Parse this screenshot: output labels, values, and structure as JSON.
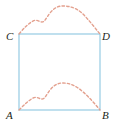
{
  "figure": {
    "type": "geometry-diagram",
    "colors": {
      "rectangle_stroke": "#8cc6e0",
      "dashed_curve": "#e3a08e",
      "label_text": "#231f20",
      "background": "#ffffff"
    },
    "rectangle": {
      "name": "rectangle-ABDC",
      "left": 19,
      "top": 34,
      "right": 100,
      "bottom": 110,
      "stroke_width": 1
    },
    "vertices": [
      {
        "id": "C",
        "label": "C",
        "position": "top-left"
      },
      {
        "id": "D",
        "label": "D",
        "position": "top-right"
      },
      {
        "id": "A",
        "label": "A",
        "position": "bottom-left"
      },
      {
        "id": "B",
        "label": "B",
        "position": "bottom-right"
      }
    ],
    "curves": [
      {
        "name": "upper-dashed-curve",
        "from": "C",
        "to": "D",
        "style": "dashed",
        "path": "M 19 34 C 24 28 28 24 33 21 C 37 19 39 22 42 22 C 45 22 46 18 50 13 C 54 8 58 6 63 6 C 70 6 76 8 82 13 C 89 20 95 28 100 34"
      },
      {
        "name": "lower-dashed-curve",
        "from": "A",
        "to": "B",
        "style": "dashed",
        "path": "M 19 110 C 24 105 28 101 33 98 C 37 96 39 99 42 99 C 45 99 46 95 50 90 C 54 85 58 83 63 83 C 70 83 76 86 82 91 C 89 97 95 104 100 110"
      }
    ]
  }
}
